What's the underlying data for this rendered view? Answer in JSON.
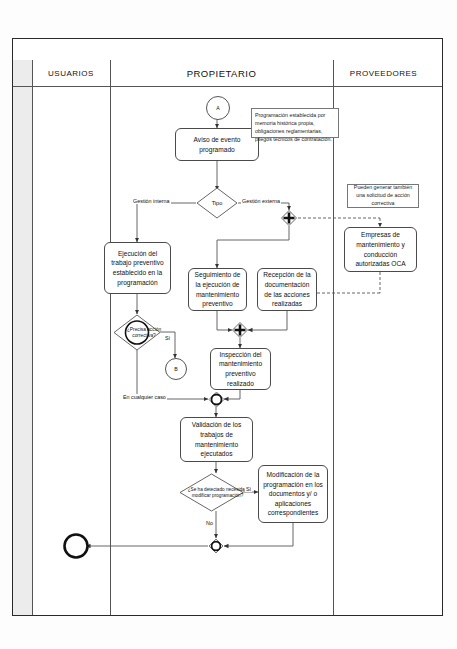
{
  "document": {
    "title": "SMA01: MANTENIMIENTO CORRECTIVO Y PREVENTIVO (II)"
  },
  "lanes": [
    {
      "id": "usuarios",
      "label": "USUARIOS"
    },
    {
      "id": "propietario",
      "label": "PROPIETARIO"
    },
    {
      "id": "proveedores",
      "label": "PROVEEDORES"
    }
  ],
  "nodes": {
    "start_connector": {
      "label": "A",
      "type": "connector"
    },
    "aviso": {
      "label": "Aviso de evento programado",
      "type": "process",
      "lane": "propietario"
    },
    "nota_programacion": {
      "label": "Programación establecida por memoria histórica propia, obligaciones reglamentarias, pliegos técnicos de contratación.",
      "type": "note"
    },
    "tipo": {
      "label": "Tipo",
      "type": "decision",
      "lane": "propietario"
    },
    "nota_proveedores": {
      "label": "Pueden generar también una solicitud de acción correctiva",
      "type": "note"
    },
    "empresas": {
      "label": "Empresas de mantenimiento y conducción autorizadas  OCA",
      "type": "process",
      "lane": "proveedores"
    },
    "ejecucion": {
      "label": "Ejecución del trabajo preventivo establecido en la programación",
      "type": "process",
      "lane": "usuarios"
    },
    "seguimiento": {
      "label": "Seguimiento de la ejecución de mantenimiento preventivo",
      "type": "process",
      "lane": "propietario"
    },
    "recepcion": {
      "label": "Recepción de la documentación de las acciones realizadas",
      "type": "process",
      "lane": "propietario"
    },
    "precisa": {
      "label": "¿Precisa acción correctiva?",
      "type": "decision",
      "lane": "usuarios"
    },
    "connector_b": {
      "label": "B",
      "type": "connector"
    },
    "inspeccion": {
      "label": "Inspección del mantenimiento preventivo realizado",
      "type": "process",
      "lane": "propietario"
    },
    "validacion": {
      "label": "Validación de los trabajos de mantenimiento ejecutados",
      "type": "process",
      "lane": "propietario"
    },
    "detectado": {
      "label": "¿Se ha detectado necesidad modificar programación?",
      "type": "decision",
      "lane": "propietario"
    },
    "modificacion": {
      "label": "Modificación de la programación en los documentos y/ o aplicaciones correspondientes",
      "type": "process",
      "lane": "propietario"
    },
    "end": {
      "label": "",
      "type": "end",
      "lane": "usuarios"
    }
  },
  "edge_labels": {
    "gestion_interna": "Gestión interna",
    "gestion_externa": "Gestión externa",
    "precisa_si": "Sí",
    "en_cualquier_caso": "En cualquier caso",
    "detectado_si": "Sí",
    "detectado_no": "No"
  },
  "colors": {
    "frame": "#2a2a2a",
    "line": "#555555",
    "gutter": "#ececec",
    "node_border": "#4a4a4a",
    "text": "#111111"
  }
}
